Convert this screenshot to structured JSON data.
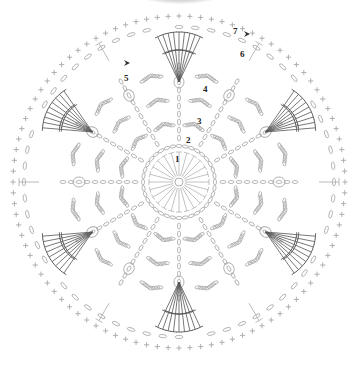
{
  "diagram": {
    "type": "crochet-chart",
    "shape": "circle",
    "center": [
      179,
      182
    ],
    "repeats": 12,
    "rounds": [
      {
        "number": "1",
        "label_pos": [
          177,
          162
        ]
      },
      {
        "number": "2",
        "label_pos": [
          188,
          143
        ]
      },
      {
        "number": "3",
        "label_pos": [
          199,
          124
        ]
      },
      {
        "number": "4",
        "label_pos": [
          205,
          92
        ]
      },
      {
        "number": "5",
        "label_pos": [
          124,
          80
        ]
      },
      {
        "number": "6",
        "label_pos": [
          240,
          57
        ]
      },
      {
        "number": "7",
        "label_pos": [
          234,
          33
        ]
      }
    ],
    "markers": [
      {
        "name": "start-arrow-right",
        "pos": [
          250,
          34
        ]
      },
      {
        "name": "start-arrow-left",
        "pos": [
          130,
          63
        ]
      }
    ],
    "colors": {
      "light_stitch": "#a8a8a8",
      "dark_stitch": "#555555",
      "label": "#222222",
      "shadow": "#c8c8c8"
    }
  }
}
